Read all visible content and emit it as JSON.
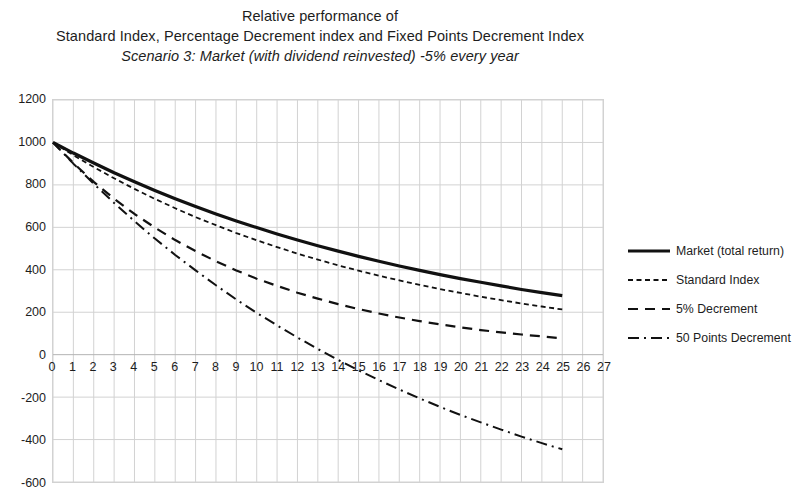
{
  "title": {
    "line1": "Relative performance of",
    "line2": "Standard Index, Percentage Decrement index and Fixed Points Decrement Index",
    "line3": "Scenario 3: Market (with dividend reinvested) -5% every year"
  },
  "chart_data": {
    "type": "line",
    "subtitle": "Scenario 3: Market (with dividend reinvested) -5% every year",
    "xlabel": "",
    "ylabel": "",
    "xlim": [
      0,
      27
    ],
    "ylim": [
      -600,
      1200
    ],
    "ytick_step": 200,
    "xtick_step": 1,
    "grid": true,
    "legend_position": "right",
    "x": [
      0,
      1,
      2,
      3,
      4,
      5,
      6,
      7,
      8,
      9,
      10,
      11,
      12,
      13,
      14,
      15,
      16,
      17,
      18,
      19,
      20,
      21,
      22,
      23,
      24,
      25
    ],
    "xticks": [
      "0",
      "1",
      "2",
      "3",
      "4",
      "5",
      "6",
      "7",
      "8",
      "9",
      "10",
      "11",
      "12",
      "13",
      "14",
      "15",
      "16",
      "17",
      "18",
      "19",
      "20",
      "21",
      "22",
      "23",
      "24",
      "25",
      "26",
      "27"
    ],
    "yticks": [
      "1200",
      "1000",
      "800",
      "600",
      "400",
      "200",
      "0",
      "-200",
      "-400",
      "-600"
    ],
    "series": [
      {
        "name": "Market (total return)",
        "style": "solid",
        "width": 3.2,
        "color": "#111111",
        "values": [
          1000,
          950,
          903,
          857,
          815,
          774,
          735,
          698,
          663,
          630,
          599,
          569,
          540,
          513,
          488,
          463,
          440,
          418,
          397,
          377,
          358,
          341,
          324,
          307,
          292,
          278
        ]
      },
      {
        "name": "Standard Index",
        "style": "dotted-dash",
        "width": 1.8,
        "color": "#111111",
        "values": [
          1000,
          940,
          884,
          831,
          781,
          734,
          690,
          648,
          610,
          573,
          539,
          507,
          476,
          448,
          421,
          396,
          372,
          350,
          329,
          309,
          291,
          273,
          257,
          241,
          227,
          213
        ]
      },
      {
        "name": "5% Decrement",
        "style": "dashed",
        "width": 2.2,
        "color": "#111111",
        "values": [
          1000,
          903,
          814,
          735,
          663,
          599,
          540,
          488,
          440,
          397,
          358,
          324,
          292,
          264,
          238,
          215,
          194,
          175,
          158,
          143,
          129,
          116,
          105,
          95,
          86,
          77
        ]
      },
      {
        "name": "50 Points Decrement",
        "style": "dashdot",
        "width": 2.0,
        "color": "#111111",
        "values": [
          1000,
          900,
          805,
          715,
          629,
          547,
          470,
          397,
          327,
          260,
          197,
          138,
          81,
          27,
          -25,
          -74,
          -120,
          -164,
          -206,
          -246,
          -284,
          -319,
          -353,
          -386,
          -417,
          -446
        ]
      }
    ]
  },
  "legend": {
    "items": [
      {
        "label": "Market (total return)",
        "style": "solid"
      },
      {
        "label": "Standard Index",
        "style": "dotted-dash"
      },
      {
        "label": "5% Decrement",
        "style": "dashed"
      },
      {
        "label": "50 Points Decrement",
        "style": "dashdot"
      }
    ]
  },
  "colors": {
    "ink": "#111111",
    "grid": "#d2d2d2",
    "axis": "#bdbdbd",
    "background": "#ffffff"
  }
}
